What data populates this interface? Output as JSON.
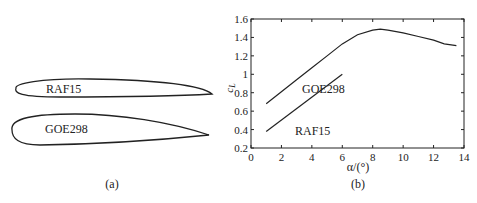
{
  "panel_a": {
    "caption": "(a)",
    "airfoils": [
      {
        "name": "RAF15"
      },
      {
        "name": "GOE298"
      }
    ]
  },
  "panel_b": {
    "caption": "(b)"
  },
  "chart_data": {
    "type": "line",
    "title": "",
    "xlabel": "α/(°)",
    "ylabel": "c_L",
    "xlim": [
      0,
      14
    ],
    "ylim": [
      0.2,
      1.6
    ],
    "xticks": [
      0,
      2,
      4,
      6,
      8,
      10,
      12,
      14
    ],
    "yticks": [
      0.2,
      0.4,
      0.6,
      0.8,
      1,
      1.2,
      1.4,
      1.6
    ],
    "grid": false,
    "legend": "inline labels",
    "series": [
      {
        "name": "GOE298",
        "x": [
          1,
          2,
          3,
          4,
          5,
          6,
          7,
          8,
          8.5,
          9,
          10,
          11,
          12,
          12.7,
          13.5
        ],
        "y": [
          0.68,
          0.81,
          0.94,
          1.07,
          1.2,
          1.33,
          1.43,
          1.48,
          1.49,
          1.48,
          1.45,
          1.41,
          1.37,
          1.33,
          1.31
        ]
      },
      {
        "name": "RAF15",
        "x": [
          1,
          6
        ],
        "y": [
          0.38,
          1.0
        ]
      }
    ]
  }
}
